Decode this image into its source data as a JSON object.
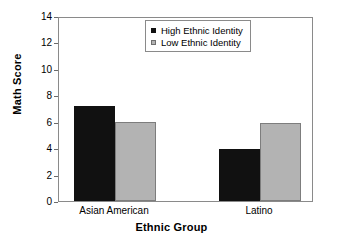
{
  "chart_data": {
    "type": "bar",
    "title": "",
    "xlabel": "Ethnic Group",
    "ylabel": "Math Score",
    "categories": [
      "Asian American",
      "Latino"
    ],
    "series": [
      {
        "name": "High Ethnic Identity",
        "values": [
          7.2,
          3.9
        ],
        "color": "#111111"
      },
      {
        "name": "Low Ethnic Identity",
        "values": [
          6.0,
          5.9
        ],
        "color": "#b3b3b3"
      }
    ],
    "ylim": [
      0,
      14
    ],
    "yticks": [
      0,
      2,
      4,
      6,
      8,
      10,
      12,
      14
    ],
    "ytick_labels": [
      "0",
      "2",
      "4",
      "6",
      "8",
      "10",
      "12",
      "14"
    ],
    "grid": false,
    "legend_position": "top-center",
    "bar_grouping": "adjacent-pairs"
  },
  "axes": {
    "y_title": "Math Score",
    "x_title": "Ethnic Group"
  },
  "legend": {
    "entries": [
      {
        "label": "High Ethnic Identity",
        "swatch": "black-square-icon"
      },
      {
        "label": "Low Ethnic Identity",
        "swatch": "gray-square-icon"
      }
    ]
  }
}
